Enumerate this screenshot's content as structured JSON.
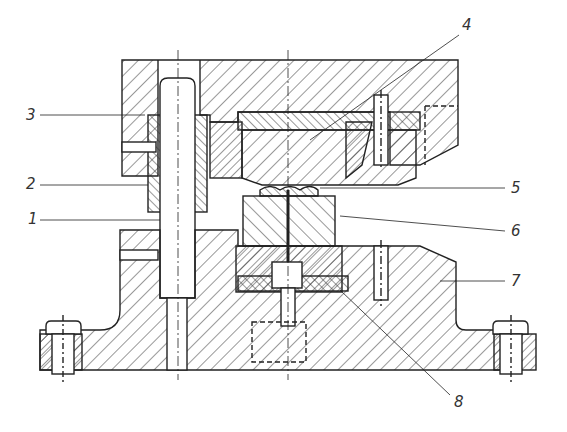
{
  "figure": {
    "type": "technical-drawing",
    "line_color": "#2a2a2a",
    "background": "#ffffff"
  },
  "callouts": [
    {
      "id": "3",
      "label": "3",
      "x": 26,
      "y": 108
    },
    {
      "id": "2",
      "label": "2",
      "x": 26,
      "y": 177
    },
    {
      "id": "1",
      "label": "1",
      "x": 28,
      "y": 212
    },
    {
      "id": "4",
      "label": "4",
      "x": 462,
      "y": 18
    },
    {
      "id": "5",
      "label": "5",
      "x": 511,
      "y": 181
    },
    {
      "id": "6",
      "label": "6",
      "x": 511,
      "y": 224
    },
    {
      "id": "7",
      "label": "7",
      "x": 511,
      "y": 274
    },
    {
      "id": "8",
      "label": "8",
      "x": 454,
      "y": 395
    }
  ]
}
